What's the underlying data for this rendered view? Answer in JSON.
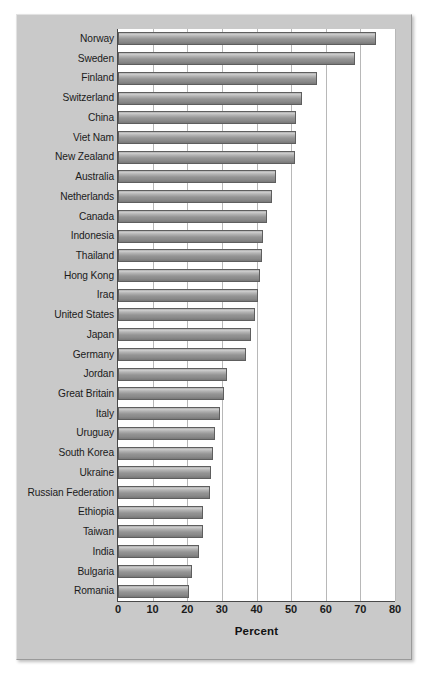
{
  "chart_data": {
    "type": "bar",
    "orientation": "horizontal",
    "title": "",
    "subtitle": "",
    "xlabel": "Percent",
    "ylabel": "",
    "xlim": [
      0,
      80
    ],
    "xticks": [
      0,
      10,
      20,
      30,
      40,
      50,
      60,
      70,
      80
    ],
    "xticklabels": [
      "0",
      "10",
      "20",
      "30",
      "40",
      "50",
      "60",
      "70",
      "80"
    ],
    "grid": "vertical",
    "legend": "none",
    "categories": [
      "Norway",
      "Sweden",
      "Finland",
      "Switzerland",
      "China",
      "Viet Nam",
      "New Zealand",
      "Australia",
      "Netherlands",
      "Canada",
      "Indonesia",
      "Thailand",
      "Hong Kong",
      "Iraq",
      "United States",
      "Japan",
      "Germany",
      "Jordan",
      "Great Britain",
      "Italy",
      "Uruguay",
      "South Korea",
      "Ukraine",
      "Russian Federation",
      "Ethiopia",
      "Taiwan",
      "India",
      "Bulgaria",
      "Romania"
    ],
    "values": [
      74.5,
      68.5,
      57.5,
      53.0,
      51.5,
      51.5,
      51.0,
      45.5,
      44.5,
      43.0,
      42.0,
      41.5,
      41.0,
      40.5,
      39.5,
      38.5,
      37.0,
      31.5,
      30.5,
      29.5,
      28.0,
      27.5,
      27.0,
      26.5,
      24.5,
      24.5,
      23.5,
      21.5,
      20.5
    ],
    "colors": {
      "bar_fill": "#a0a0a0",
      "bar_edge": "#5e5e5e",
      "panel_background": "#c9c9c9",
      "plot_background": "#ffffff",
      "gridline": "#b8b8b8",
      "axis": "#4a4a4a",
      "text": "#1b1b1b"
    }
  }
}
